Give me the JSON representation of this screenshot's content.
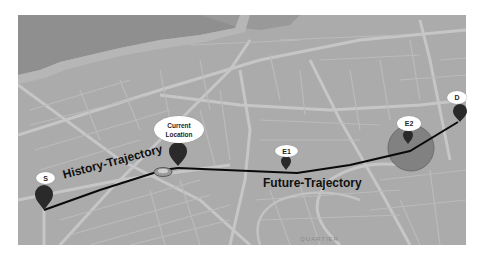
{
  "map": {
    "background_color": "#a9a9a9",
    "water_color": "#8e8e8e",
    "road_color": "#c4c4c4",
    "district_label": "QUARTIER"
  },
  "markers": {
    "start": {
      "label": "S"
    },
    "current": {
      "label_line1": "Current",
      "label_line2": "Location"
    },
    "e1": {
      "label": "E1"
    },
    "e2": {
      "label": "E2"
    },
    "destination": {
      "label": "D"
    }
  },
  "trajectories": {
    "history": {
      "label": "History-Trajectory"
    },
    "future": {
      "label": "Future-Trajectory"
    }
  },
  "colors": {
    "path": "#0a0a0a",
    "pin": "#2a2a2a",
    "zone_fill": "#7d7d7d",
    "zone_stroke": "#666666",
    "bubble": "#ffffff"
  }
}
